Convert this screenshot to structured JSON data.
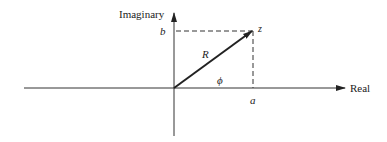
{
  "diagram": {
    "type": "complex-plane",
    "labels": {
      "imaginary_axis": "Imaginary",
      "real_axis": "Real",
      "b": "b",
      "a": "a",
      "z": "z",
      "R": "R",
      "phi": "ϕ"
    },
    "colors": {
      "ink": "#222222",
      "background": "#ffffff"
    }
  }
}
